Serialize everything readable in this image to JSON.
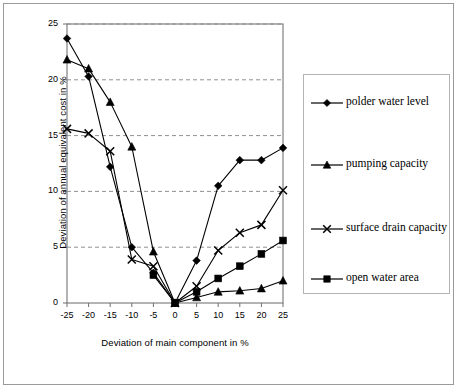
{
  "chart_data": {
    "type": "line",
    "title": "",
    "xlabel": "Deviation of main component in %",
    "ylabel": "Deviation of annual equivalent cost in %",
    "x": [
      -25,
      -20,
      -15,
      -10,
      -5,
      0,
      5,
      10,
      15,
      20,
      25
    ],
    "xlim": [
      -25,
      25
    ],
    "ylim": [
      0,
      25
    ],
    "xticks": [
      "-25",
      "-20",
      "-15",
      "-10",
      "-5",
      "0",
      "5",
      "10",
      "15",
      "20",
      "25"
    ],
    "yticks": [
      "0",
      "5",
      "10",
      "15",
      "20",
      "25"
    ],
    "grid": "horizontal dashed",
    "legend_position": "right",
    "series": [
      {
        "name": "polder water level",
        "marker": "diamond",
        "values": [
          23.7,
          20.3,
          12.2,
          5.0,
          2.7,
          0.0,
          3.8,
          10.5,
          12.8,
          12.8,
          13.9
        ]
      },
      {
        "name": "pumping capacity",
        "marker": "triangle",
        "values": [
          21.8,
          21.0,
          18.0,
          14.0,
          4.6,
          0.0,
          0.5,
          1.0,
          1.1,
          1.3,
          2.0
        ]
      },
      {
        "name": "surface drain capacity",
        "marker": "cross",
        "values": [
          15.6,
          15.2,
          13.6,
          3.9,
          3.3,
          0.0,
          1.5,
          4.7,
          6.3,
          7.0,
          10.1
        ]
      },
      {
        "name": "open water area",
        "marker": "square",
        "values": [
          null,
          null,
          null,
          null,
          2.5,
          0.0,
          1.0,
          2.2,
          3.3,
          4.4,
          5.6
        ]
      }
    ]
  },
  "legend": {
    "items": [
      {
        "label": "polder water level",
        "marker": "diamond"
      },
      {
        "label": "pumping capacity",
        "marker": "triangle"
      },
      {
        "label": "surface drain capacity",
        "marker": "cross"
      },
      {
        "label": "open water area",
        "marker": "square"
      }
    ]
  },
  "axes": {
    "x_title": "Deviation of main component in %",
    "y_title": "Deviation of annual equivalent cost in %"
  }
}
